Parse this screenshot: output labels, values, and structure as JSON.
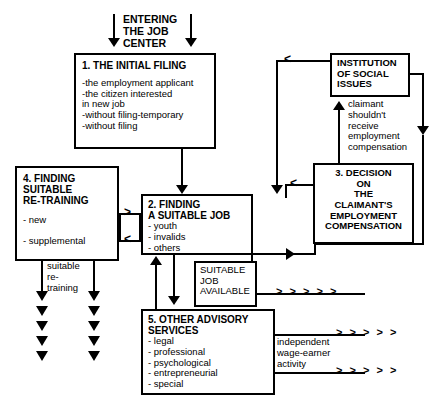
{
  "diagram": {
    "entry_label": "ENTERING\nTHE JOB\nCENTER",
    "boxes": {
      "initial_filing": {
        "title": "1. THE INITIAL FILING",
        "items": "-the employment applicant\n-the citizen interested\n in new job\n-without filing-temporary\n-without filing"
      },
      "finding_job": {
        "title": "2. FINDING\nA SUITABLE JOB",
        "items": "- youth\n- invalids\n- others"
      },
      "decision": {
        "title": "3. DECISION\nON\nTHE\nCLAIMANT'S\nEMPLOYMENT\nCOMPENSATION",
        "items": ""
      },
      "retraining": {
        "title": "4. FINDING\n    SUITABLE\n    RE-TRAINING",
        "items": "- new\n\n- supplemental"
      },
      "advisory": {
        "title": "5. OTHER ADVISORY\nSERVICES",
        "items": "- legal\n- professional\n- psychological\n- entrepreneurial\n- special"
      },
      "institution": {
        "title": "INSTITUTION\nOF SOCIAL\nISSUES",
        "items": ""
      },
      "job_available": {
        "title": "SUITABLE\nJOB\nAVAILABLE",
        "items": ""
      }
    },
    "labels": {
      "claimant_note": "claimant\nshouldn't\nreceive\nemployment\ncompensation",
      "suitable_retraining": "suitable\nre-\ntraining",
      "independent_activity": "independent\nwage-earner\nactivity",
      "outflow_1": "> > > > >",
      "outflow_2": "> > > > >",
      "outflow_3": "> > > > >"
    },
    "connector_marks": {
      "to_job_from_retraining": ">",
      "from_job_to_retraining": "<",
      "institution_inflow": "<",
      "decision_inflow": "<"
    },
    "colors": {
      "stroke": "#000000",
      "background": "#ffffff",
      "text": "#000000"
    },
    "counts": {
      "retraining_arrows_left": 5,
      "retraining_arrows_right": 5
    }
  }
}
